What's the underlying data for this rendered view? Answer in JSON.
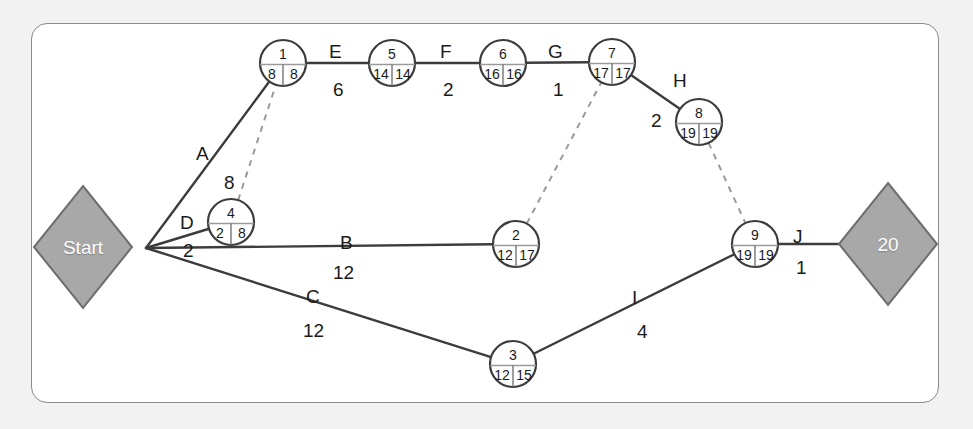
{
  "diagram": {
    "type": "pert-cpm-network",
    "title_visible": false,
    "colors": {
      "page_background": "#f2f2f2",
      "panel_background": "#ffffff",
      "panel_border": "#8a8a8a",
      "node_stroke": "#3c3c3c",
      "edge_stroke": "#3c3c3c",
      "dashed_stroke": "#9a9a9a",
      "milestone_fill": "#a8a8a8",
      "milestone_stroke": "#6e6e6e",
      "milestone_text": "#ffffff",
      "text": "#1a1a1a"
    }
  },
  "milestones": [
    {
      "id": "start",
      "label": "Start",
      "cx": 83,
      "cy": 247,
      "rx": 49,
      "ry": 61
    },
    {
      "id": "finish",
      "label": "20",
      "cx": 888,
      "cy": 244,
      "rx": 49,
      "ry": 61
    }
  ],
  "junction": {
    "x": 146,
    "y": 248
  },
  "nodes": [
    {
      "id": "n1",
      "number": "1",
      "early": "8",
      "late": "8",
      "cx": 283,
      "cy": 63,
      "r": 23
    },
    {
      "id": "n5",
      "number": "5",
      "early": "14",
      "late": "14",
      "cx": 392,
      "cy": 63,
      "r": 23
    },
    {
      "id": "n6",
      "number": "6",
      "early": "16",
      "late": "16",
      "cx": 503,
      "cy": 63,
      "r": 23
    },
    {
      "id": "n7",
      "number": "7",
      "early": "17",
      "late": "17",
      "cx": 612,
      "cy": 62,
      "r": 23
    },
    {
      "id": "n8",
      "number": "8",
      "early": "19",
      "late": "19",
      "cx": 699,
      "cy": 122,
      "r": 23
    },
    {
      "id": "n4",
      "number": "4",
      "early": "2",
      "late": "8",
      "cx": 231,
      "cy": 222,
      "r": 23
    },
    {
      "id": "n2",
      "number": "2",
      "early": "12",
      "late": "17",
      "cx": 516,
      "cy": 244,
      "r": 23
    },
    {
      "id": "n9",
      "number": "9",
      "early": "19",
      "late": "19",
      "cx": 755,
      "cy": 244,
      "r": 23
    },
    {
      "id": "n3",
      "number": "3",
      "early": "12",
      "late": "15",
      "cx": 513,
      "cy": 364,
      "r": 23
    }
  ],
  "activities": [
    {
      "id": "A",
      "name": "A",
      "duration": "8",
      "from": "junction",
      "to": "n1",
      "style": "solid",
      "name_x": 196,
      "name_y": 144,
      "dur_x": 224,
      "dur_y": 173
    },
    {
      "id": "D",
      "name": "D",
      "duration": "2",
      "from": "junction",
      "to": "n4",
      "style": "solid",
      "name_x": 180,
      "name_y": 213,
      "dur_x": 183,
      "dur_y": 241
    },
    {
      "id": "B",
      "name": "B",
      "duration": "12",
      "from": "junction",
      "to": "n2",
      "style": "solid",
      "name_x": 340,
      "name_y": 233,
      "dur_x": 333,
      "dur_y": 263
    },
    {
      "id": "C",
      "name": "C",
      "duration": "12",
      "from": "junction",
      "to": "n3",
      "style": "solid",
      "name_x": 306,
      "name_y": 287,
      "dur_x": 303,
      "dur_y": 321
    },
    {
      "id": "E",
      "name": "E",
      "duration": "6",
      "from": "n1",
      "to": "n5",
      "style": "solid",
      "name_x": 329,
      "name_y": 42,
      "dur_x": 333,
      "dur_y": 80
    },
    {
      "id": "F",
      "name": "F",
      "duration": "2",
      "from": "n5",
      "to": "n6",
      "style": "solid",
      "name_x": 440,
      "name_y": 42,
      "dur_x": 443,
      "dur_y": 80
    },
    {
      "id": "G",
      "name": "G",
      "duration": "1",
      "from": "n6",
      "to": "n7",
      "style": "solid",
      "name_x": 548,
      "name_y": 42,
      "dur_x": 553,
      "dur_y": 80
    },
    {
      "id": "H",
      "name": "H",
      "duration": "2",
      "from": "n7",
      "to": "n8",
      "style": "solid",
      "name_x": 673,
      "name_y": 71,
      "dur_x": 651,
      "dur_y": 111
    },
    {
      "id": "I",
      "name": "I",
      "duration": "4",
      "from": "n3",
      "to": "n9",
      "style": "solid",
      "name_x": 632,
      "name_y": 288,
      "dur_x": 637,
      "dur_y": 322
    },
    {
      "id": "J",
      "name": "J",
      "duration": "1",
      "from": "n9",
      "to": "finish",
      "style": "solid",
      "name_x": 793,
      "name_y": 227,
      "dur_x": 796,
      "dur_y": 258
    }
  ],
  "dummy_activities": [
    {
      "id": "d1",
      "from": "n4",
      "to": "n1",
      "style": "dashed"
    },
    {
      "id": "d2",
      "from": "n2",
      "to": "n7",
      "style": "dashed"
    },
    {
      "id": "d3",
      "from": "n8",
      "to": "n9",
      "style": "dashed"
    }
  ],
  "chart_data": {
    "type": "diagram",
    "subtype": "activity-on-arrow network (PERT/CPM)",
    "node_fields": [
      "event number",
      "earliest event time",
      "latest event time"
    ],
    "events": [
      {
        "event": 1,
        "earliest": 8,
        "latest": 8
      },
      {
        "event": 2,
        "earliest": 12,
        "latest": 17
      },
      {
        "event": 3,
        "earliest": 12,
        "latest": 15
      },
      {
        "event": 4,
        "earliest": 2,
        "latest": 8
      },
      {
        "event": 5,
        "earliest": 14,
        "latest": 14
      },
      {
        "event": 6,
        "earliest": 16,
        "latest": 16
      },
      {
        "event": 7,
        "earliest": 17,
        "latest": 17
      },
      {
        "event": 8,
        "earliest": 19,
        "latest": 19
      },
      {
        "event": 9,
        "earliest": 19,
        "latest": 19
      }
    ],
    "edges": [
      {
        "activity": "A",
        "duration": 8,
        "from": "Start",
        "to": 1
      },
      {
        "activity": "B",
        "duration": 12,
        "from": "Start",
        "to": 2
      },
      {
        "activity": "C",
        "duration": 12,
        "from": "Start",
        "to": 3
      },
      {
        "activity": "D",
        "duration": 2,
        "from": "Start",
        "to": 4
      },
      {
        "activity": "E",
        "duration": 6,
        "from": 1,
        "to": 5
      },
      {
        "activity": "F",
        "duration": 2,
        "from": 5,
        "to": 6
      },
      {
        "activity": "G",
        "duration": 1,
        "from": 6,
        "to": 7
      },
      {
        "activity": "H",
        "duration": 2,
        "from": 7,
        "to": 8
      },
      {
        "activity": "I",
        "duration": 4,
        "from": 3,
        "to": 9
      },
      {
        "activity": "J",
        "duration": 1,
        "from": 9,
        "to": "20"
      },
      {
        "activity": "dummy",
        "duration": 0,
        "from": 4,
        "to": 1
      },
      {
        "activity": "dummy",
        "duration": 0,
        "from": 2,
        "to": 7
      },
      {
        "activity": "dummy",
        "duration": 0,
        "from": 8,
        "to": 9
      }
    ],
    "terminals": [
      {
        "label": "Start",
        "shape": "diamond"
      },
      {
        "label": "20",
        "shape": "diamond"
      }
    ],
    "project_duration": 20
  }
}
